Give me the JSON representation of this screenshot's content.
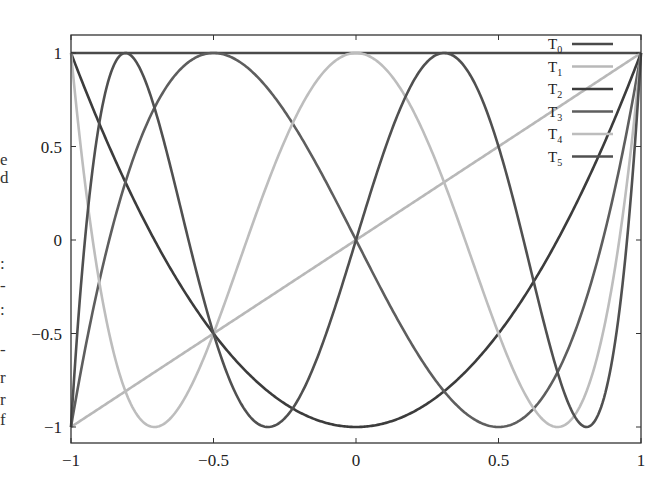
{
  "page_fragments": [
    "e",
    "d",
    ":",
    "-",
    ":",
    "-",
    "r",
    "r",
    "f"
  ],
  "chart_data": {
    "type": "line",
    "title": "",
    "xlabel": "",
    "ylabel": "",
    "xlim": [
      -1,
      1
    ],
    "ylim": [
      -1.05,
      1.05
    ],
    "x_ticks": [
      "-1",
      "-0.5",
      "0",
      "0.5",
      "1"
    ],
    "y_ticks": [
      "-1",
      "-0.5",
      "0",
      "0.5",
      "1"
    ],
    "grid": false,
    "legend_position": "upper right",
    "series": [
      {
        "name": "T0",
        "label_base": "T",
        "label_sub": "0",
        "formula": "1",
        "color": "#4a4a4a"
      },
      {
        "name": "T1",
        "label_base": "T",
        "label_sub": "1",
        "formula": "x",
        "color": "#b8b8b8"
      },
      {
        "name": "T2",
        "label_base": "T",
        "label_sub": "2",
        "formula": "2x^2-1",
        "color": "#3c3c3c"
      },
      {
        "name": "T3",
        "label_base": "T",
        "label_sub": "3",
        "formula": "4x^3-3x",
        "color": "#5e5e5e"
      },
      {
        "name": "T4",
        "label_base": "T",
        "label_sub": "4",
        "formula": "8x^4-8x^2+1",
        "color": "#bdbdbd"
      },
      {
        "name": "T5",
        "label_base": "T",
        "label_sub": "5",
        "formula": "16x^5-20x^3+5x",
        "color": "#505050"
      }
    ],
    "sample_points": {
      "x": [
        -1,
        -0.5,
        0,
        0.5,
        1
      ],
      "T0": [
        1,
        1,
        1,
        1,
        1
      ],
      "T1": [
        -1,
        -0.5,
        0,
        0.5,
        1
      ],
      "T2": [
        1,
        -0.5,
        -1,
        -0.5,
        1
      ],
      "T3": [
        -1,
        1,
        0,
        -1,
        1
      ],
      "T4": [
        1,
        -0.5,
        1,
        -0.5,
        1
      ],
      "T5": [
        -1,
        -0.5,
        0,
        0.5,
        1
      ]
    }
  }
}
